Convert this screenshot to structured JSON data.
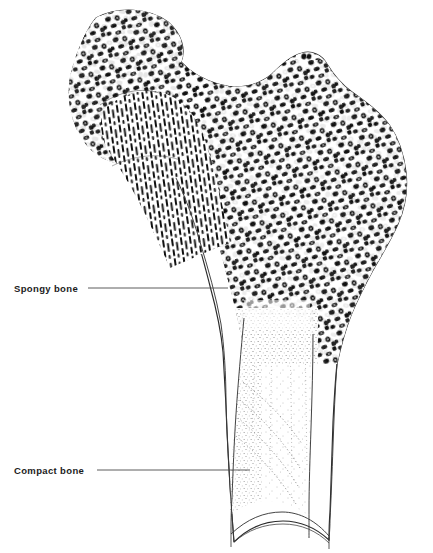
{
  "figure": {
    "background_color": "#ffffff",
    "ink_color": "#1c1c1c",
    "outline_color": "#2b2b2b",
    "leader_color": "#4a4a4a"
  },
  "labels": [
    {
      "id": "spongy-bone",
      "text": "Spongy bone",
      "text_x": 14,
      "text_y": 292,
      "leader": {
        "x1": 88,
        "y1": 288,
        "x2": 228,
        "y2": 288
      }
    },
    {
      "id": "compact-bone",
      "text": "Compact bone",
      "text_x": 14,
      "text_y": 474,
      "leader": {
        "x1": 97,
        "y1": 470,
        "x2": 250,
        "y2": 470
      }
    }
  ],
  "regions": [
    {
      "id": "femoral-head",
      "name": "Femoral head",
      "texture": "trabecular-blobs"
    },
    {
      "id": "femoral-neck",
      "name": "Femoral neck",
      "texture": "trabecular-vertical-striae"
    },
    {
      "id": "greater-trochanter",
      "name": "Greater trochanter",
      "texture": "trabecular-blobs"
    },
    {
      "id": "medullary-cavity",
      "name": "Medullary cavity",
      "texture": "fine-stipple"
    },
    {
      "id": "compact-cortex",
      "name": "Compact cortical wall",
      "texture": "solid-white"
    },
    {
      "id": "diaphysis",
      "name": "Shaft / diaphysis",
      "texture": "solid-white"
    }
  ],
  "caption": ""
}
